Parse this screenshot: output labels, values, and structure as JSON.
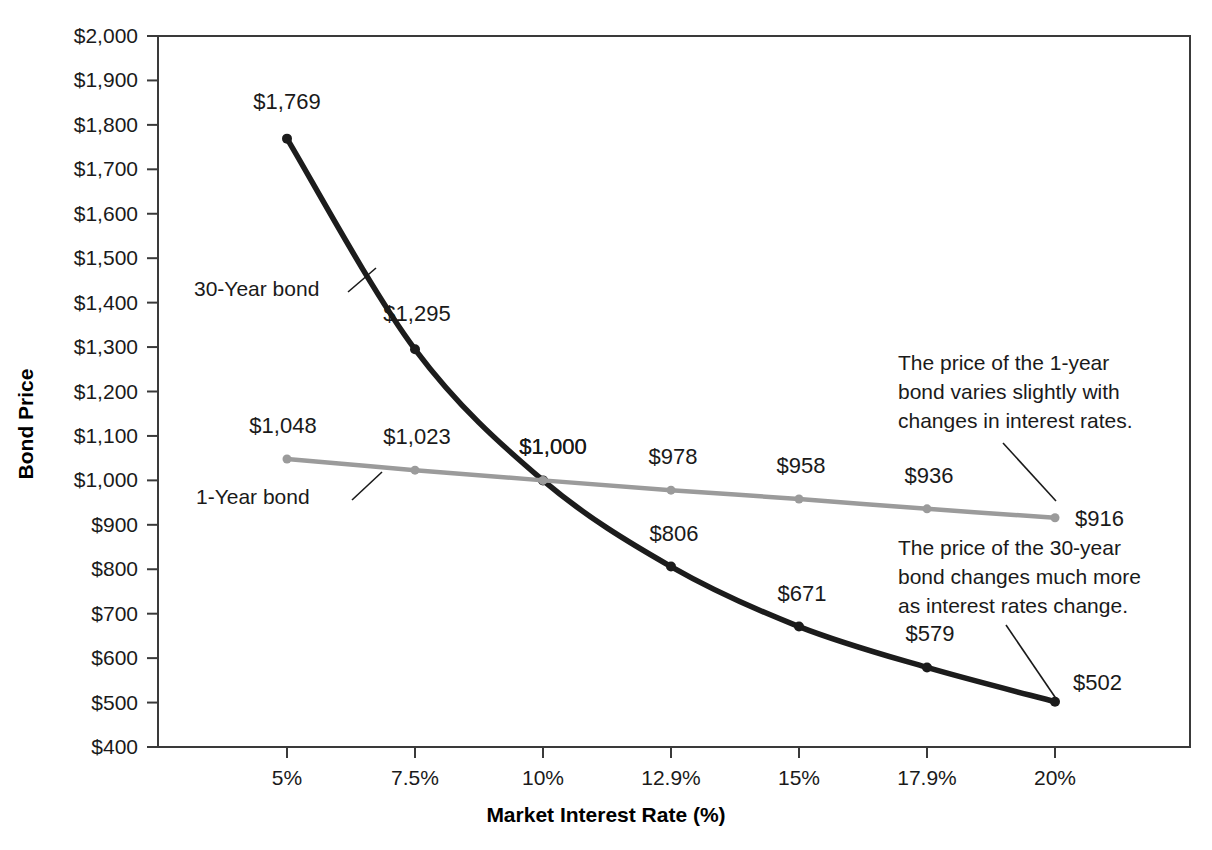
{
  "chart_data": {
    "type": "line",
    "title": "",
    "xlabel": "Market Interest Rate (%)",
    "ylabel": "Bond Price",
    "categories": [
      "5%",
      "7.5%",
      "10%",
      "12.9%",
      "15%",
      "17.9%",
      "20%"
    ],
    "x_values": [
      5,
      7.5,
      10,
      12.9,
      15,
      17.9,
      20
    ],
    "ylim": [
      400,
      2000
    ],
    "ytick_step": 100,
    "ytick_labels": [
      "$2,000",
      "$1,900",
      "$1,800",
      "$1,700",
      "$1,600",
      "$1,500",
      "$1,400",
      "$1,300",
      "$1,200",
      "$1,100",
      "$1,000",
      "$900",
      "$800",
      "$700",
      "$600",
      "$500",
      "$400"
    ],
    "ytick_values": [
      2000,
      1900,
      1800,
      1700,
      1600,
      1500,
      1400,
      1300,
      1200,
      1100,
      1000,
      900,
      800,
      700,
      600,
      500,
      400
    ],
    "grid": false,
    "legend_position": "inline-annotations",
    "series": [
      {
        "name": "30-Year bond",
        "color": "#1c1c1c",
        "values": [
          1769,
          1295,
          1000,
          806,
          671,
          579,
          502
        ],
        "labels": [
          "$1,769",
          "$1,295",
          "$1,000",
          "$806",
          "$671",
          "$579",
          "$502"
        ]
      },
      {
        "name": "1-Year bond",
        "color": "#9b9b9b",
        "values": [
          1048,
          1023,
          1000,
          978,
          958,
          936,
          916
        ],
        "labels": [
          "$1,048",
          "$1,023",
          "$1,000",
          "$978",
          "$958",
          "$936",
          "$916"
        ]
      }
    ],
    "annotations": [
      {
        "name": "annotation-one-year",
        "lines": [
          "The price of the 1-year",
          "bond varies slightly with",
          "changes in interest rates."
        ]
      },
      {
        "name": "annotation-thirty-year",
        "lines": [
          "The price of the 30-year",
          "bond changes much more",
          "as interest rates change."
        ]
      }
    ],
    "series_callouts": [
      "30-Year bond",
      "1-Year bond"
    ]
  },
  "colors": {
    "thirty_year": "#1c1c1c",
    "one_year": "#9b9b9b",
    "frame": "#3a3a3a",
    "text": "#1a1a1a",
    "background": "#ffffff"
  }
}
